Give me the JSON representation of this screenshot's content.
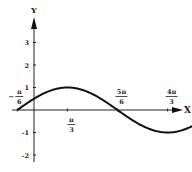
{
  "chart_data": {
    "type": "line",
    "title": "",
    "function": "y = sin(x + π/6)",
    "xlabel": "X",
    "ylabel": "Y",
    "xlim": [
      -0.5236,
      6.2832
    ],
    "ylim": [
      -2.4,
      3.6
    ],
    "grid": false,
    "legend": null,
    "x_ticks": [
      {
        "value": -0.5236,
        "label_num": "π",
        "label_den": "6",
        "label_sign": "−",
        "position": "above"
      },
      {
        "value": 1.0472,
        "label_num": "π",
        "label_den": "3",
        "label_sign": "",
        "position": "below"
      },
      {
        "value": 2.618,
        "label_num": "5π",
        "label_den": "6",
        "label_sign": "",
        "position": "above"
      },
      {
        "value": 4.1888,
        "label_num": "4π",
        "label_den": "3",
        "label_sign": "",
        "position": "above"
      },
      {
        "value": 5.7596,
        "label_num": "11π",
        "label_den": "6",
        "label_sign": "",
        "position": "below"
      }
    ],
    "y_ticks": [
      {
        "value": 3,
        "label": "3"
      },
      {
        "value": 2,
        "label": "2"
      },
      {
        "value": 1,
        "label": "1"
      },
      {
        "value": -1,
        "label": "-1"
      },
      {
        "value": -2,
        "label": "-2"
      }
    ],
    "series": [
      {
        "name": "sin(x + π/6)",
        "x": [
          -0.5236,
          0,
          0.5236,
          1.0472,
          1.5708,
          2.0944,
          2.618,
          3.1416,
          3.6652,
          4.1888,
          4.7124,
          5.236,
          5.7596
        ],
        "values": [
          0,
          0.5,
          0.866,
          1,
          0.866,
          0.5,
          0,
          -0.5,
          -0.866,
          -1,
          -0.866,
          -0.5,
          0
        ]
      }
    ]
  },
  "axes": {
    "x_label": "X",
    "y_label": "Y"
  }
}
